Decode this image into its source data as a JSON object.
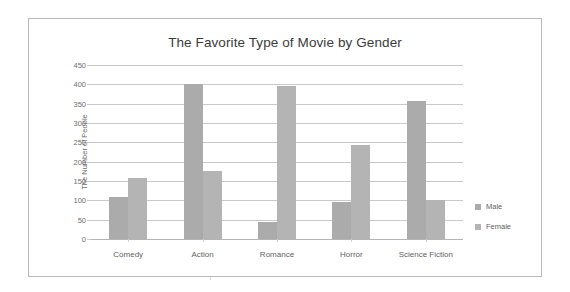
{
  "chart_data": {
    "type": "bar",
    "title": "The Favorite Type of Movie by Gender",
    "xlabel": "",
    "ylabel": "The Number of People",
    "categories": [
      "Comedy",
      "Action",
      "Romance",
      "Horror",
      "Science Fiction"
    ],
    "series": [
      {
        "name": "Male",
        "color": "#ababab",
        "values": [
          108,
          400,
          45,
          95,
          358
        ]
      },
      {
        "name": "Female",
        "color": "#b4b4b4",
        "values": [
          157,
          175,
          395,
          243,
          100
        ]
      }
    ],
    "ylim": [
      0,
      450
    ],
    "ytick_step": 50,
    "yticks": [
      450,
      400,
      350,
      300,
      250,
      200,
      150,
      100,
      50,
      0
    ],
    "ytick_labels": [
      "450",
      "400",
      "350",
      "300",
      "250",
      "200",
      "150",
      "100",
      "50",
      "0"
    ],
    "grid": true,
    "legend_position": "right"
  },
  "legend": {
    "items": [
      {
        "label": "Male",
        "color": "#ababab"
      },
      {
        "label": "Female",
        "color": "#b4b4b4"
      }
    ]
  },
  "colors": {
    "frame": "#b9b9b9",
    "gridline": "#c9c9c9",
    "text": "#5f5f5f",
    "title": "#3b3b3b",
    "background": "#ffffff"
  }
}
